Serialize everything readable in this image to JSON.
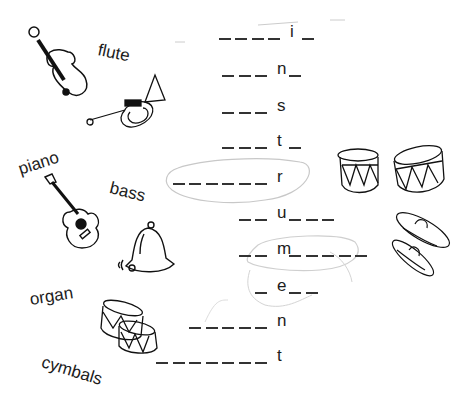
{
  "worksheet": {
    "word_bank": [
      {
        "id": "flute",
        "label": "flute",
        "x": 98,
        "y": 45,
        "rot": 12
      },
      {
        "id": "piano",
        "label": "piano",
        "x": 19,
        "y": 160,
        "rot": -18
      },
      {
        "id": "bass",
        "label": "bass",
        "x": 110,
        "y": 183,
        "rot": 14
      },
      {
        "id": "organ",
        "label": "organ",
        "x": 30,
        "y": 293,
        "rot": -9
      },
      {
        "id": "cymbals",
        "label": "cymbals",
        "x": 42,
        "y": 360,
        "rot": 17
      }
    ],
    "puzzle_rows": [
      {
        "letter": "i",
        "before": 4,
        "after": 1,
        "y": 23
      },
      {
        "letter": "n",
        "before": 3,
        "after": 1,
        "y": 60
      },
      {
        "letter": "s",
        "before": 3,
        "after": 0,
        "y": 97
      },
      {
        "letter": "t",
        "before": 3,
        "after": 1,
        "y": 132
      },
      {
        "letter": "r",
        "before": 6,
        "after": 0,
        "y": 168
      },
      {
        "letter": "u",
        "before": 2,
        "after": 3,
        "y": 204
      },
      {
        "letter": "m",
        "before": 2,
        "after": 5,
        "y": 240
      },
      {
        "letter": "e",
        "before": 1,
        "after": 2,
        "y": 277
      },
      {
        "letter": "n",
        "before": 5,
        "after": 0,
        "y": 312
      },
      {
        "letter": "t",
        "before": 7,
        "after": 0,
        "y": 347
      }
    ],
    "pictures": [
      "violin",
      "trumpet",
      "guitar",
      "bell",
      "drums",
      "drums",
      "cymbals"
    ]
  }
}
